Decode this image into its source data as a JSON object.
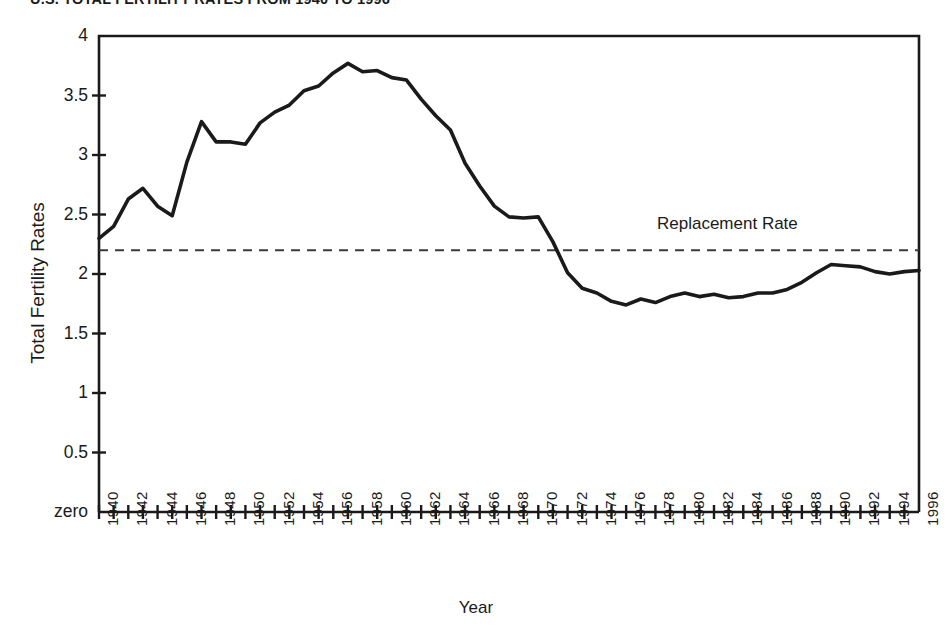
{
  "chart_data": {
    "type": "line",
    "title": "U.S. TOTAL FERTILITY RATES FROM 1940 TO 1996",
    "xlabel": "Year",
    "ylabel": "Total Fertility Rates",
    "xlim": [
      1940,
      1996
    ],
    "ylim": [
      0,
      4
    ],
    "grid": false,
    "legend": "none",
    "y_tick_labels": [
      "4",
      "3.5",
      "3",
      "2.5",
      "2",
      "1.5",
      "1",
      "0.5",
      "zero"
    ],
    "y_tick_values": [
      4,
      3.5,
      3,
      2.5,
      2,
      1.5,
      1,
      0.5,
      0
    ],
    "x_tick_labels": [
      "1940",
      "1942",
      "1944",
      "1946",
      "1948",
      "1950",
      "1952",
      "1954",
      "1956",
      "1958",
      "1960",
      "1962",
      "1964",
      "1966",
      "1968",
      "1970",
      "1972",
      "1974",
      "1976",
      "1978",
      "1980",
      "1982",
      "1984",
      "1986",
      "1988",
      "1990",
      "1992",
      "1994",
      "1996"
    ],
    "x_minor_tick_step": 1,
    "annotations": [
      {
        "text": "Replacement Rate",
        "type": "threshold-line",
        "value": 2.2,
        "style": "dashed"
      }
    ],
    "series": [
      {
        "name": "Total Fertility Rate",
        "style": "solid",
        "color": "#1a1a1a",
        "x": [
          1940,
          1941,
          1942,
          1943,
          1944,
          1945,
          1946,
          1947,
          1948,
          1949,
          1950,
          1951,
          1952,
          1953,
          1954,
          1955,
          1956,
          1957,
          1958,
          1959,
          1960,
          1961,
          1962,
          1963,
          1964,
          1965,
          1966,
          1967,
          1968,
          1969,
          1970,
          1971,
          1972,
          1973,
          1974,
          1975,
          1976,
          1977,
          1978,
          1979,
          1980,
          1981,
          1982,
          1983,
          1984,
          1985,
          1986,
          1987,
          1988,
          1989,
          1990,
          1991,
          1992,
          1993,
          1994,
          1995,
          1996
        ],
        "values": [
          2.3,
          2.4,
          2.63,
          2.72,
          2.57,
          2.49,
          2.94,
          3.28,
          3.11,
          3.11,
          3.09,
          3.27,
          3.36,
          3.42,
          3.54,
          3.58,
          3.69,
          3.77,
          3.7,
          3.71,
          3.65,
          3.63,
          3.47,
          3.33,
          3.21,
          2.93,
          2.74,
          2.57,
          2.48,
          2.47,
          2.48,
          2.27,
          2.01,
          1.88,
          1.84,
          1.77,
          1.74,
          1.79,
          1.76,
          1.81,
          1.84,
          1.81,
          1.83,
          1.8,
          1.81,
          1.84,
          1.84,
          1.87,
          1.93,
          2.01,
          2.08,
          2.07,
          2.06,
          2.02,
          2.0,
          2.02,
          2.03
        ]
      }
    ]
  },
  "labels": {
    "replacement_rate": "Replacement Rate"
  }
}
